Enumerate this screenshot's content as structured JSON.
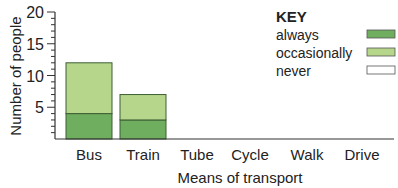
{
  "chart_data": {
    "type": "bar",
    "stacked": true,
    "title": "",
    "xlabel": "Means of transport",
    "ylabel": "Number of people",
    "ylim": [
      0,
      20
    ],
    "yticks": [
      5,
      10,
      15,
      20
    ],
    "minor_tick_step": 1,
    "grid": false,
    "categories": [
      "Bus",
      "Train",
      "Tube",
      "Cycle",
      "Walk",
      "Drive"
    ],
    "series": [
      {
        "name": "always",
        "color": "#6fae5f",
        "values": [
          4,
          3,
          0,
          0,
          0,
          0
        ]
      },
      {
        "name": "occasionally",
        "color": "#b6d68c",
        "values": [
          8,
          4,
          0,
          0,
          0,
          0
        ]
      },
      {
        "name": "never",
        "color": "#ffffff",
        "values": [
          0,
          0,
          0,
          0,
          0,
          0
        ]
      }
    ],
    "legend": {
      "title": "KEY",
      "position": "top-right",
      "entries": [
        "always",
        "occasionally",
        "never"
      ]
    }
  }
}
